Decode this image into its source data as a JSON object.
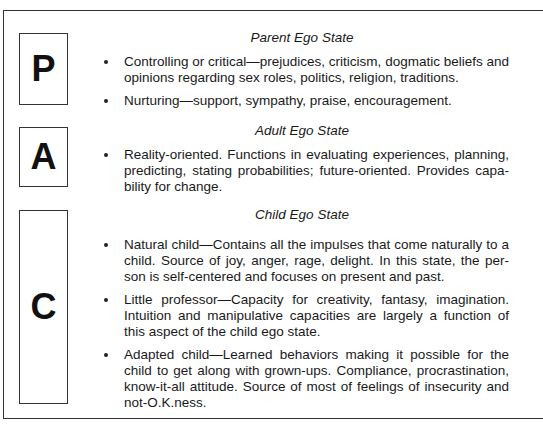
{
  "sections": [
    {
      "letter": "P",
      "heading": "Parent Ego State",
      "bullets": [
        "Controlling or critical—prejudices, criticism, dogmatic beliefs and opinions regarding sex roles, politics, religion, traditions.",
        "Nurturing—support, sympathy, praise, encouragement."
      ]
    },
    {
      "letter": "A",
      "heading": "Adult Ego State",
      "bullets": [
        "Reality-oriented. Functions in evaluating experiences, planning, predicting, stating probabilities; future-oriented. Provides capa-bility for change."
      ]
    },
    {
      "letter": "C",
      "heading": "Child Ego State",
      "bullets": [
        "Natural child—Contains all the impulses that come naturally to a child. Source of joy, anger, rage, delight. In this state, the per-son is self-centered and focuses on present and past.",
        "Little professor—Capacity for creativity, fantasy, imagination. Intuition and manipulative capacities are largely a function of this aspect of the child ego state.",
        "Adapted child—Learned behaviors making it possible for the child to get along with grown-ups. Compliance, procrastination, know-it-all attitude. Source of most of feelings of insecurity and not-O.K.ness."
      ]
    }
  ]
}
